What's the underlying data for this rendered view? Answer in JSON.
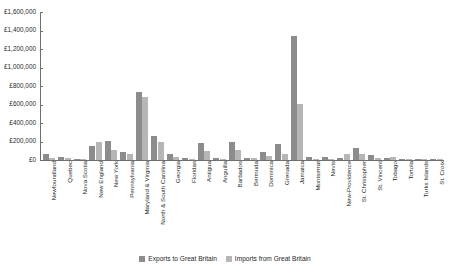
{
  "chart_data": {
    "type": "bar",
    "title": "",
    "xlabel": "",
    "ylabel": "",
    "ylim": [
      0,
      1600000
    ],
    "ytick_step": 200000,
    "grid": false,
    "legend_position": "bottom-center",
    "currency_symbol": "£",
    "ytick_labels": [
      "£1,600,000",
      "£1,400,000",
      "£1,200,000",
      "£1,000,000",
      "£800,000",
      "£600,000",
      "£400,000",
      "£200,000",
      "£0"
    ],
    "categories": [
      "Newfoundland",
      "Quebec",
      "Nova Scotia",
      "New England",
      "New York",
      "Pennsylvania",
      "Maryland & Virginia",
      "North & South Carolina",
      "Georgia",
      "Floridas",
      "Antigua",
      "Anguilla",
      "Barbados",
      "Bermuda",
      "Dominica",
      "Grenada",
      "Jamaica",
      "Montserrat",
      "Nevis",
      "New-Providence",
      "St. Christopher",
      "St. Vincent",
      "Tobago",
      "Tortola",
      "Turks Islands",
      "St. Croix"
    ],
    "series": [
      {
        "name": "Exports to Great Britain",
        "color": "#8c8c8c",
        "values": [
          60000,
          30000,
          12000,
          150000,
          205000,
          90000,
          740000,
          255000,
          60000,
          25000,
          185000,
          20000,
          195000,
          20000,
          85000,
          170000,
          1340000,
          32000,
          38000,
          18000,
          130000,
          55000,
          22000,
          16000,
          6000,
          5000
        ]
      },
      {
        "name": "Imports from Great Britain",
        "color": "#b6b6b6",
        "values": [
          22000,
          22000,
          14000,
          200000,
          105000,
          68000,
          680000,
          195000,
          35000,
          10000,
          95000,
          9000,
          110000,
          18000,
          45000,
          70000,
          610000,
          12000,
          14000,
          60000,
          70000,
          20000,
          30000,
          8000,
          10000,
          4000
        ]
      }
    ]
  },
  "legend": {
    "items": [
      {
        "label": "Exports to Great Britain"
      },
      {
        "label": "Imports from Great Britain"
      }
    ]
  }
}
